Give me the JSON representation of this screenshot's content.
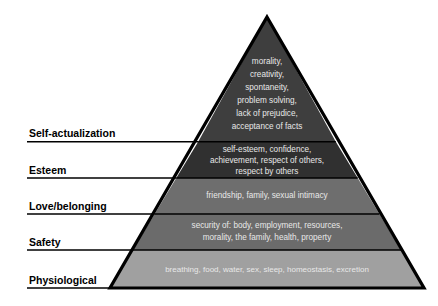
{
  "diagram": {
    "type": "pyramid",
    "tiers": [
      {
        "id": "self-actualization",
        "label": "Self-actualization",
        "color": "#3e3e3e",
        "lines": [
          "morality,",
          "creativity,",
          "spontaneity,",
          "problem solving,",
          "lack of prejudice,",
          "acceptance of facts"
        ]
      },
      {
        "id": "esteem",
        "label": "Esteem",
        "color": "#303030",
        "lines": [
          "self-esteem, confidence,",
          "achievement, respect of others,",
          "respect by others"
        ]
      },
      {
        "id": "love-belonging",
        "label": "Love/belonging",
        "color": "#6e6e6e",
        "lines": [
          "friendship, family, sexual intimacy"
        ]
      },
      {
        "id": "safety",
        "label": "Safety",
        "color": "#6b6b6b",
        "lines": [
          "security of: body, employment, resources,",
          "morality, the family, health, property"
        ]
      },
      {
        "id": "physiological",
        "label": "Physiological",
        "color": "#a0a0a0",
        "lines": [
          "breathing, food, water, sex, sleep, homeostasis, excretion"
        ]
      }
    ],
    "colors": {
      "outline": "#000000",
      "tier_text": "#e8e8e8",
      "label_text": "#000000",
      "background": "#ffffff"
    }
  }
}
